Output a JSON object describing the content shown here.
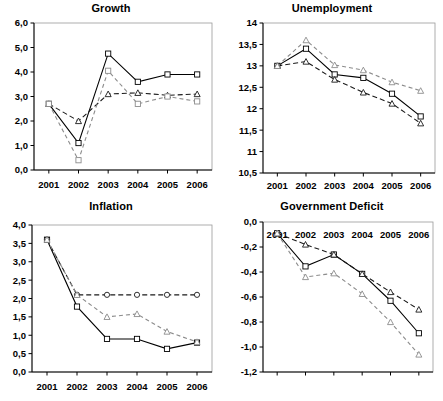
{
  "figure": {
    "background": "#ffffff",
    "panel_count": 4
  },
  "panels": [
    {
      "key": "growth",
      "title": "Growth"
    },
    {
      "key": "unemployment",
      "title": "Unemployment"
    },
    {
      "key": "inflation",
      "title": "Inflation"
    },
    {
      "key": "deficit",
      "title": "Government Deficit"
    }
  ],
  "chart_data": [
    {
      "type": "line",
      "title": "Growth",
      "xlabel": "",
      "ylabel": "",
      "x": [
        2001,
        2002,
        2003,
        2004,
        2005,
        2006
      ],
      "categories": [
        "2001",
        "2002",
        "2003",
        "2004",
        "2005",
        "2006"
      ],
      "xlim": [
        2000.5,
        2006.5
      ],
      "ylim": [
        0.0,
        6.0
      ],
      "yticks": [
        0.0,
        1.0,
        2.0,
        3.0,
        4.0,
        5.0,
        6.0
      ],
      "ytick_labels": [
        "0,0",
        "1,0",
        "2,0",
        "3,0",
        "4,0",
        "5,0",
        "6,0"
      ],
      "grid": false,
      "legend": "none",
      "series": [
        {
          "name": "series-1",
          "style": "solid",
          "marker": "square",
          "color": "#000000",
          "values": [
            2.7,
            1.1,
            4.75,
            3.6,
            3.9,
            3.9
          ]
        },
        {
          "name": "series-2",
          "style": "dashed-dark",
          "marker": "triangle",
          "color": "#1a1a1a",
          "values": [
            2.7,
            2.0,
            3.1,
            3.15,
            3.05,
            3.1
          ]
        },
        {
          "name": "series-3",
          "style": "dashed-light",
          "marker": "square",
          "color": "#8c8c8c",
          "values": [
            2.7,
            0.4,
            4.05,
            2.7,
            3.0,
            2.8
          ]
        }
      ]
    },
    {
      "type": "line",
      "title": "Unemployment",
      "xlabel": "",
      "ylabel": "",
      "x": [
        2001,
        2002,
        2003,
        2004,
        2005,
        2006
      ],
      "categories": [
        "2001",
        "2002",
        "2003",
        "2004",
        "2005",
        "2006"
      ],
      "xlim": [
        2000.5,
        2006.5
      ],
      "ylim": [
        10.5,
        14.0
      ],
      "yticks": [
        10.5,
        11.0,
        11.5,
        12.0,
        12.5,
        13.0,
        13.5,
        14.0
      ],
      "ytick_labels": [
        "10,5",
        "11",
        "11,5",
        "12",
        "12,5",
        "13",
        "13,5",
        "14"
      ],
      "grid": false,
      "legend": "none",
      "series": [
        {
          "name": "series-1",
          "style": "solid",
          "marker": "square",
          "color": "#000000",
          "values": [
            13.0,
            13.4,
            12.8,
            12.72,
            12.35,
            11.82
          ]
        },
        {
          "name": "series-2",
          "style": "dashed-dark",
          "marker": "triangle",
          "color": "#1a1a1a",
          "values": [
            13.0,
            13.1,
            12.68,
            12.38,
            12.12,
            11.66
          ]
        },
        {
          "name": "series-3",
          "style": "dashed-light",
          "marker": "triangle",
          "color": "#8c8c8c",
          "values": [
            13.0,
            13.6,
            13.02,
            12.9,
            12.62,
            12.42
          ]
        }
      ]
    },
    {
      "type": "line",
      "title": "Inflation",
      "xlabel": "",
      "ylabel": "",
      "x": [
        2001,
        2002,
        2003,
        2004,
        2005,
        2006
      ],
      "categories": [
        "2001",
        "2002",
        "2003",
        "2004",
        "2005",
        "2006"
      ],
      "xlim": [
        2000.5,
        2006.5
      ],
      "ylim": [
        0.0,
        4.0
      ],
      "yticks": [
        0.0,
        0.5,
        1.0,
        1.5,
        2.0,
        2.5,
        3.0,
        3.5,
        4.0
      ],
      "ytick_labels": [
        "0,0",
        "0,5",
        "1,0",
        "1,5",
        "2,0",
        "2,5",
        "3,0",
        "3,5",
        "4,0"
      ],
      "grid": false,
      "legend": "none",
      "series": [
        {
          "name": "series-1",
          "style": "solid",
          "marker": "square",
          "color": "#000000",
          "values": [
            3.6,
            1.78,
            0.9,
            0.9,
            0.63,
            0.8
          ]
        },
        {
          "name": "series-2",
          "style": "dashed-dark",
          "marker": "circle",
          "color": "#1a1a1a",
          "values": [
            3.6,
            2.1,
            2.1,
            2.1,
            2.1,
            2.1
          ]
        },
        {
          "name": "series-3",
          "style": "dashed-light",
          "marker": "triangle",
          "color": "#8c8c8c",
          "values": [
            3.6,
            2.1,
            1.5,
            1.58,
            1.1,
            0.82
          ]
        }
      ]
    },
    {
      "type": "line",
      "title": "Government Deficit",
      "xlabel": "",
      "ylabel": "",
      "x": [
        2001,
        2002,
        2003,
        2004,
        2005,
        2006
      ],
      "categories": [
        "2001",
        "2002",
        "2003",
        "2004",
        "2005",
        "2006"
      ],
      "xlim": [
        2000.5,
        2006.5
      ],
      "ylim": [
        -1.2,
        0.0
      ],
      "yticks": [
        -1.2,
        -1.0,
        -0.8,
        -0.6,
        -0.4,
        -0.2,
        0.0
      ],
      "ytick_labels": [
        "-1,2",
        "-1,0",
        "-0,8",
        "-0,6",
        "-0,4",
        "-0,2",
        "0,0"
      ],
      "grid": false,
      "legend": "none",
      "series": [
        {
          "name": "series-1",
          "style": "solid",
          "marker": "square",
          "color": "#000000",
          "values": [
            -0.09,
            -0.355,
            -0.26,
            -0.415,
            -0.63,
            -0.89
          ]
        },
        {
          "name": "series-2",
          "style": "dashed-dark",
          "marker": "triangle",
          "color": "#1a1a1a",
          "values": [
            -0.09,
            -0.18,
            -0.26,
            -0.415,
            -0.56,
            -0.7
          ]
        },
        {
          "name": "series-3",
          "style": "dashed-light",
          "marker": "triangle",
          "color": "#8c8c8c",
          "values": [
            -0.09,
            -0.44,
            -0.41,
            -0.575,
            -0.8,
            -1.06
          ]
        }
      ]
    }
  ]
}
